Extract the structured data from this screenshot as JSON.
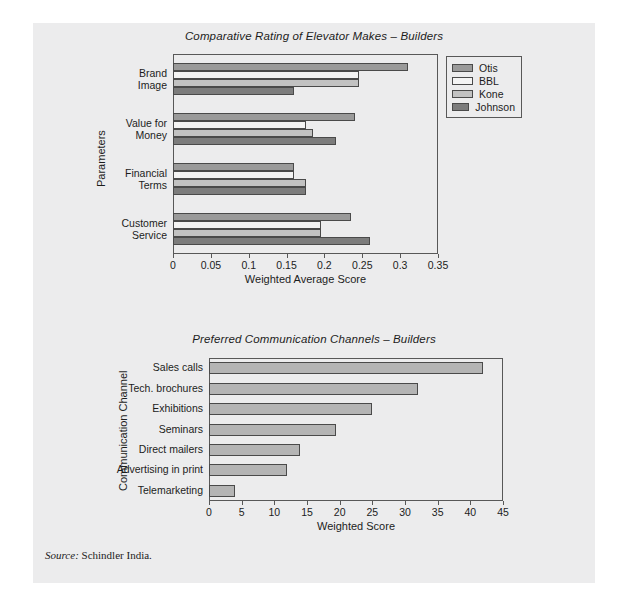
{
  "source_note": {
    "label": "Source:",
    "text": "Schindler India."
  },
  "chart_data": [
    {
      "type": "bar",
      "orientation": "horizontal",
      "grouped": true,
      "title": "Comparative Rating of Elevator Makes – Builders",
      "xlabel": "Weighted Average Score",
      "ylabel": "Parameters",
      "categories": [
        "Brand Image",
        "Value for Money",
        "Financial Terms",
        "Customer Service"
      ],
      "category_lines": [
        [
          "Brand",
          "Image"
        ],
        [
          "Value for",
          "Money"
        ],
        [
          "Financial",
          "Terms"
        ],
        [
          "Customer",
          "Service"
        ]
      ],
      "xlim": [
        0,
        0.35
      ],
      "xticks": [
        0,
        0.05,
        0.1,
        0.15,
        0.2,
        0.25,
        0.3,
        0.35
      ],
      "xtick_labels": [
        "0",
        "0.05",
        "0.1",
        "0.15",
        "0.2",
        "0.25",
        "0.3",
        "0.35"
      ],
      "grid": false,
      "legend_position": "top-right",
      "series": [
        {
          "name": "Otis",
          "color": "#9a9a9a",
          "values": [
            0.31,
            0.24,
            0.16,
            0.235
          ]
        },
        {
          "name": "BBL",
          "color": "#f4f4f4",
          "values": [
            0.245,
            0.175,
            0.16,
            0.195
          ]
        },
        {
          "name": "Kone",
          "color": "#c2c2c2",
          "values": [
            0.245,
            0.185,
            0.175,
            0.195
          ]
        },
        {
          "name": "Johnson",
          "color": "#7c7c7c",
          "values": [
            0.16,
            0.215,
            0.175,
            0.26
          ]
        }
      ]
    },
    {
      "type": "bar",
      "orientation": "horizontal",
      "grouped": false,
      "title": "Preferred Communication Channels – Builders",
      "xlabel": "Weighted Score",
      "ylabel": "Communication Channel",
      "categories": [
        "Sales calls",
        "Tech. brochures",
        "Exhibitions",
        "Seminars",
        "Direct mailers",
        "Advertising in print",
        "Telemarketing"
      ],
      "values": [
        42,
        32,
        25,
        19.5,
        14,
        12,
        4
      ],
      "xlim": [
        0,
        45
      ],
      "xticks": [
        0,
        5,
        10,
        15,
        20,
        25,
        30,
        35,
        40,
        45
      ],
      "xtick_labels": [
        "0",
        "5",
        "10",
        "15",
        "20",
        "25",
        "30",
        "35",
        "40",
        "45"
      ],
      "grid": false,
      "bar_color": "#b4b4b4"
    }
  ]
}
